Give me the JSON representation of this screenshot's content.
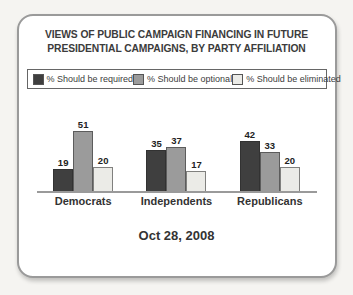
{
  "page": {
    "background": "#f5f4f1",
    "card_border": "#9a9a9a"
  },
  "chart_data": {
    "type": "bar",
    "title": "VIEWS OF PUBLIC CAMPAIGN FINANCING IN FUTURE PRESIDENTIAL CAMPAIGNS, BY PARTY AFFILIATION",
    "title_lines": [
      "VIEWS OF PUBLIC CAMPAIGN FINANCING IN FUTURE",
      "PRESIDENTIAL CAMPAIGNS, BY PARTY AFFILIATION"
    ],
    "categories": [
      "Democrats",
      "Independents",
      "Republicans"
    ],
    "series": [
      {
        "name": "% Should be required",
        "color": "#3f3f3f",
        "values": [
          19,
          35,
          42
        ]
      },
      {
        "name": "% Should be optional",
        "color": "#9b9b9b",
        "values": [
          51,
          37,
          33
        ]
      },
      {
        "name": "% Should be eliminated",
        "color": "#ebebe7",
        "values": [
          20,
          17,
          20
        ]
      }
    ],
    "data_labels": true,
    "legend_position": "top",
    "grid": false,
    "xlabel": "",
    "ylabel": "",
    "ylim": [
      0,
      60
    ],
    "footer": "Oct 28, 2008"
  }
}
